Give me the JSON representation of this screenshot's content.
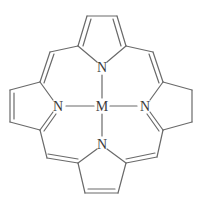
{
  "diagram": {
    "type": "chemical-structure",
    "title": "",
    "bond_color": "#6a6a6a",
    "label_color": "#3a3a3a",
    "atoms": [
      {
        "id": "M",
        "label": "M",
        "x": 102,
        "y": 106
      },
      {
        "id": "N_top",
        "label": "N",
        "x": 102,
        "y": 67
      },
      {
        "id": "N_left",
        "label": "N",
        "x": 58,
        "y": 106
      },
      {
        "id": "N_right",
        "label": "N",
        "x": 145,
        "y": 106
      },
      {
        "id": "N_bottom",
        "label": "N",
        "x": 102,
        "y": 144
      }
    ],
    "labels": {
      "metal": "M",
      "n_top": "N",
      "n_left": "N",
      "n_right": "N",
      "n_bottom": "N"
    }
  }
}
